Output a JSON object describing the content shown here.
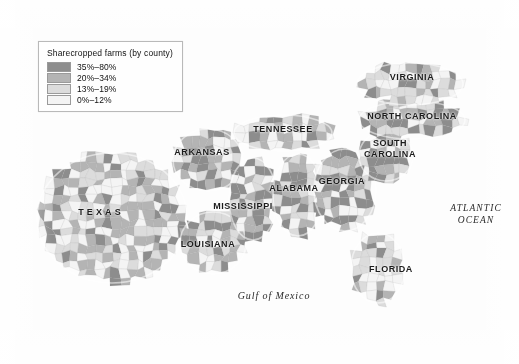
{
  "figure": {
    "kind": "choropleth-map",
    "region": "American South",
    "background_color": "#fdfdfd"
  },
  "legend": {
    "title": "Sharecropped farms (by county)",
    "entries": [
      {
        "label": "35%–80%",
        "color": "#8d8d8d"
      },
      {
        "label": "20%–34%",
        "color": "#b4b4b4"
      },
      {
        "label": "13%–19%",
        "color": "#dcdcdc"
      },
      {
        "label": "0%–12%",
        "color": "#f4f4f4"
      }
    ]
  },
  "state_labels": [
    {
      "name": "virginia",
      "text": "VIRGINIA",
      "x": 412,
      "y": 77,
      "style": "normal"
    },
    {
      "name": "north-carolina",
      "text": "NORTH CAROLINA",
      "x": 412,
      "y": 116,
      "style": "normal"
    },
    {
      "name": "south-carolina",
      "text": "SOUTH\nCAROLINA",
      "x": 390,
      "y": 149,
      "style": "two-line"
    },
    {
      "name": "tennessee",
      "text": "TENNESSEE",
      "x": 283,
      "y": 129,
      "style": "normal"
    },
    {
      "name": "arkansas",
      "text": "ARKANSAS",
      "x": 202,
      "y": 152,
      "style": "normal"
    },
    {
      "name": "georgia",
      "text": "GEORGIA",
      "x": 342,
      "y": 181,
      "style": "normal"
    },
    {
      "name": "alabama",
      "text": "ALABAMA",
      "x": 294,
      "y": 188,
      "style": "normal"
    },
    {
      "name": "mississippi",
      "text": "MISSISSIPPI",
      "x": 243,
      "y": 206,
      "style": "normal"
    },
    {
      "name": "texas",
      "text": "TEXAS",
      "x": 101,
      "y": 212,
      "style": "wide"
    },
    {
      "name": "louisiana",
      "text": "LOUISIANA",
      "x": 208,
      "y": 244,
      "style": "normal"
    },
    {
      "name": "florida",
      "text": "FLORIDA",
      "x": 391,
      "y": 269,
      "style": "normal"
    }
  ],
  "water_labels": [
    {
      "name": "atlantic-ocean",
      "text": "ATLANTIC\nOCEAN",
      "x": 476,
      "y": 214,
      "style": "ocean"
    },
    {
      "name": "gulf-of-mexico",
      "text": "Gulf of Mexico",
      "x": 274,
      "y": 296,
      "style": "gulf"
    }
  ],
  "map_data": {
    "description": "Grayscale county choropleth of sharecropped farm percentage across the US South. Darkest concentrations form the Black Belt band through central Georgia, eastern Alabama, Mississippi Delta, and the Carolina coastal plain.",
    "shade_scale": [
      "#f4f4f4",
      "#dcdcdc",
      "#b4b4b4",
      "#8d8d8d"
    ],
    "state_outline_color": "#ffffff",
    "coast_outline_color": "#c9c9c9",
    "regions": [
      {
        "state": "texas",
        "seed": 17,
        "cx": 112,
        "cy": 218,
        "rx": 74,
        "ry": 64,
        "weights": [
          0.3,
          0.24,
          0.26,
          0.2
        ]
      },
      {
        "state": "louisiana",
        "seed": 23,
        "cx": 213,
        "cy": 243,
        "rx": 32,
        "ry": 30,
        "weights": [
          0.18,
          0.22,
          0.3,
          0.3
        ]
      },
      {
        "state": "arkansas",
        "seed": 31,
        "cx": 208,
        "cy": 160,
        "rx": 34,
        "ry": 30,
        "weights": [
          0.2,
          0.24,
          0.28,
          0.28
        ]
      },
      {
        "state": "mississippi",
        "seed": 41,
        "cx": 253,
        "cy": 199,
        "rx": 23,
        "ry": 40,
        "weights": [
          0.14,
          0.2,
          0.3,
          0.36
        ]
      },
      {
        "state": "alabama",
        "seed": 53,
        "cx": 298,
        "cy": 195,
        "rx": 24,
        "ry": 40,
        "weights": [
          0.16,
          0.22,
          0.28,
          0.34
        ]
      },
      {
        "state": "georgia",
        "seed": 61,
        "cx": 345,
        "cy": 190,
        "rx": 30,
        "ry": 40,
        "weights": [
          0.12,
          0.2,
          0.28,
          0.4
        ]
      },
      {
        "state": "tennessee",
        "seed": 71,
        "cx": 283,
        "cy": 133,
        "rx": 48,
        "ry": 17,
        "weights": [
          0.28,
          0.28,
          0.26,
          0.18
        ]
      },
      {
        "state": "south-carolina",
        "seed": 83,
        "cx": 386,
        "cy": 156,
        "rx": 26,
        "ry": 24,
        "weights": [
          0.12,
          0.18,
          0.3,
          0.4
        ]
      },
      {
        "state": "north-carolina",
        "seed": 97,
        "cx": 412,
        "cy": 120,
        "rx": 52,
        "ry": 18,
        "weights": [
          0.18,
          0.24,
          0.3,
          0.28
        ]
      },
      {
        "state": "virginia",
        "seed": 103,
        "cx": 410,
        "cy": 84,
        "rx": 52,
        "ry": 20,
        "weights": [
          0.26,
          0.28,
          0.26,
          0.2
        ]
      },
      {
        "state": "florida",
        "seed": 113,
        "cx": 378,
        "cy": 268,
        "rx": 26,
        "ry": 34,
        "weights": [
          0.46,
          0.26,
          0.18,
          0.1
        ]
      }
    ]
  }
}
